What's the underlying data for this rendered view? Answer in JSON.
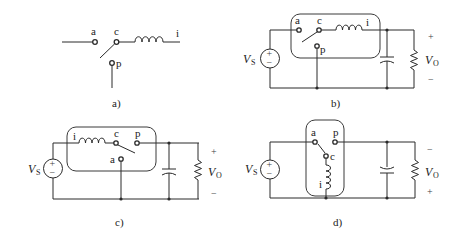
{
  "figure": {
    "panels": [
      {
        "id": "a",
        "caption": "a)",
        "terminals": {
          "a": "a",
          "c": "c",
          "p": "p",
          "i": "i"
        }
      },
      {
        "id": "b",
        "caption": "b)",
        "terminals": {
          "a": "a",
          "c": "c",
          "p": "p",
          "i": "i"
        },
        "source_label": "V",
        "source_sub": "S",
        "output_label": "V",
        "output_sub": "O",
        "polarity_top": "+",
        "polarity_bottom": "−",
        "source_plus": "+",
        "source_minus": "−"
      },
      {
        "id": "c",
        "caption": "c)",
        "terminals": {
          "a": "a",
          "c": "c",
          "p": "p",
          "i": "i"
        },
        "source_label": "V",
        "source_sub": "S",
        "output_label": "V",
        "output_sub": "O",
        "polarity_top": "+",
        "polarity_bottom": "−",
        "source_plus": "+",
        "source_minus": "−"
      },
      {
        "id": "d",
        "caption": "d)",
        "terminals": {
          "a": "a",
          "c": "c",
          "p": "p",
          "i": "i"
        },
        "source_label": "V",
        "source_sub": "S",
        "output_label": "V",
        "output_sub": "O",
        "polarity_top": "−",
        "polarity_bottom": "+",
        "source_plus": "+",
        "source_minus": "−"
      }
    ]
  }
}
